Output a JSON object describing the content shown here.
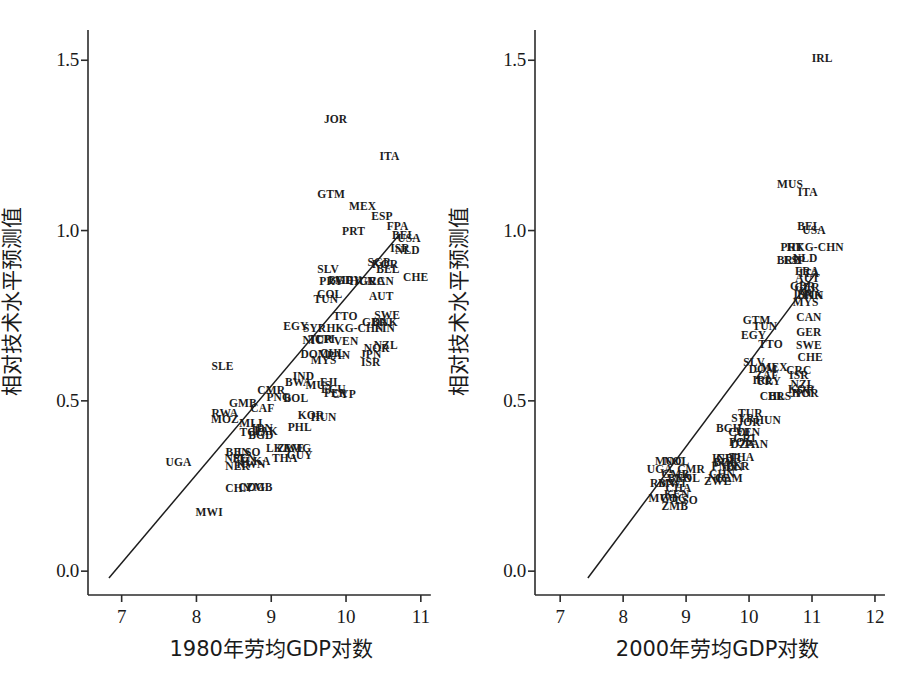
{
  "figure": {
    "width": 901,
    "height": 677,
    "background": "#ffffff",
    "ink_color": "#1d1d1d"
  },
  "chart_data": [
    {
      "type": "scatter",
      "panel": "left",
      "title": "",
      "xlabel": "1980年劳均GDP对数",
      "ylabel": "相对技术水平预测值",
      "xlim": [
        6.55,
        11.35
      ],
      "ylim": [
        -0.07,
        1.58
      ],
      "xticks": [
        7,
        8,
        9,
        10,
        11
      ],
      "xtick_labels": [
        "7",
        "8",
        "9",
        "10",
        "11"
      ],
      "yticks": [
        0.0,
        0.5,
        1.0,
        1.5
      ],
      "ytick_labels": [
        "0.0",
        "0.5",
        "1.0",
        "1.5"
      ],
      "grid": false,
      "legend": "none",
      "fit_line": {
        "x0": 6.83,
        "y0": -0.02,
        "x1": 10.72,
        "y1": 0.99
      },
      "point_label_field": "iso3",
      "points": [
        {
          "iso3": "JOR",
          "x": 9.86,
          "y": 1.325
        },
        {
          "iso3": "ITA",
          "x": 10.58,
          "y": 1.215
        },
        {
          "iso3": "GTM",
          "x": 9.8,
          "y": 1.105
        },
        {
          "iso3": "MEX",
          "x": 10.22,
          "y": 1.07
        },
        {
          "iso3": "ESP",
          "x": 10.48,
          "y": 1.04
        },
        {
          "iso3": "FPA",
          "x": 10.69,
          "y": 1.01
        },
        {
          "iso3": "PRT",
          "x": 10.1,
          "y": 0.995
        },
        {
          "iso3": "BEL",
          "x": 10.77,
          "y": 0.985
        },
        {
          "iso3": "USA",
          "x": 10.84,
          "y": 0.975
        },
        {
          "iso3": "ISR",
          "x": 10.72,
          "y": 0.945
        },
        {
          "iso3": "NLD",
          "x": 10.82,
          "y": 0.94
        },
        {
          "iso3": "SGP",
          "x": 10.44,
          "y": 0.905
        },
        {
          "iso3": "KOR",
          "x": 10.52,
          "y": 0.898
        },
        {
          "iso3": "SLV",
          "x": 9.76,
          "y": 0.885
        },
        {
          "iso3": "BEL2",
          "x": 10.56,
          "y": 0.885
        },
        {
          "iso3": "CHE",
          "x": 10.93,
          "y": 0.862
        },
        {
          "iso3": "PRY",
          "x": 9.8,
          "y": 0.85
        },
        {
          "iso3": "BGD2",
          "x": 9.93,
          "y": 0.852
        },
        {
          "iso3": "MFY",
          "x": 10.03,
          "y": 0.852
        },
        {
          "iso3": "HUN2",
          "x": 10.22,
          "y": 0.848
        },
        {
          "iso3": "GRC",
          "x": 10.35,
          "y": 0.848
        },
        {
          "iso3": "CAN",
          "x": 10.47,
          "y": 0.848
        },
        {
          "iso3": "COL",
          "x": 9.78,
          "y": 0.81
        },
        {
          "iso3": "AUT",
          "x": 10.47,
          "y": 0.805
        },
        {
          "iso3": "TUN",
          "x": 9.73,
          "y": 0.795
        },
        {
          "iso3": "TTO",
          "x": 9.99,
          "y": 0.745
        },
        {
          "iso3": "SWE",
          "x": 10.55,
          "y": 0.748
        },
        {
          "iso3": "GBR",
          "x": 10.38,
          "y": 0.73
        },
        {
          "iso3": "DNK",
          "x": 10.52,
          "y": 0.728
        },
        {
          "iso3": "EGY",
          "x": 9.33,
          "y": 0.718
        },
        {
          "iso3": "SYR",
          "x": 9.58,
          "y": 0.71
        },
        {
          "iso3": "HKG-CHN",
          "x": 10.12,
          "y": 0.712
        },
        {
          "iso3": "FIN",
          "x": 10.52,
          "y": 0.71
        },
        {
          "iso3": "NIC",
          "x": 9.56,
          "y": 0.675
        },
        {
          "iso3": "TUR",
          "x": 9.66,
          "y": 0.678
        },
        {
          "iso3": "CPI",
          "x": 9.72,
          "y": 0.678
        },
        {
          "iso3": "VEN",
          "x": 10.0,
          "y": 0.672
        },
        {
          "iso3": "NOR",
          "x": 10.41,
          "y": 0.652
        },
        {
          "iso3": "NZL",
          "x": 10.53,
          "y": 0.66
        },
        {
          "iso3": "DOM",
          "x": 9.58,
          "y": 0.635
        },
        {
          "iso3": "CHL",
          "x": 9.82,
          "y": 0.638
        },
        {
          "iso3": "PAN",
          "x": 9.9,
          "y": 0.632
        },
        {
          "iso3": "JPN",
          "x": 10.33,
          "y": 0.635
        },
        {
          "iso3": "MYS",
          "x": 9.7,
          "y": 0.618
        },
        {
          "iso3": "ISR2",
          "x": 10.33,
          "y": 0.612
        },
        {
          "iso3": "SLE",
          "x": 8.35,
          "y": 0.6
        },
        {
          "iso3": "IND",
          "x": 9.43,
          "y": 0.57
        },
        {
          "iso3": "BWA",
          "x": 9.36,
          "y": 0.553
        },
        {
          "iso3": "MUS",
          "x": 9.63,
          "y": 0.545
        },
        {
          "iso3": "FJI",
          "x": 9.77,
          "y": 0.552
        },
        {
          "iso3": "ECU",
          "x": 9.83,
          "y": 0.533
        },
        {
          "iso3": "PER",
          "x": 9.86,
          "y": 0.52
        },
        {
          "iso3": "CYP",
          "x": 9.97,
          "y": 0.517
        },
        {
          "iso3": "CMR",
          "x": 9.0,
          "y": 0.528
        },
        {
          "iso3": "PNG",
          "x": 9.1,
          "y": 0.508
        },
        {
          "iso3": "BOL",
          "x": 9.33,
          "y": 0.505
        },
        {
          "iso3": "GMB",
          "x": 8.62,
          "y": 0.49
        },
        {
          "iso3": "CAF",
          "x": 8.88,
          "y": 0.477
        },
        {
          "iso3": "RWA",
          "x": 8.38,
          "y": 0.462
        },
        {
          "iso3": "KOR2",
          "x": 9.53,
          "y": 0.455
        },
        {
          "iso3": "HUN",
          "x": 9.7,
          "y": 0.45
        },
        {
          "iso3": "MOZ",
          "x": 8.38,
          "y": 0.443
        },
        {
          "iso3": "MLI",
          "x": 8.73,
          "y": 0.433
        },
        {
          "iso3": "IDN",
          "x": 8.88,
          "y": 0.418
        },
        {
          "iso3": "PAK",
          "x": 8.93,
          "y": 0.41
        },
        {
          "iso3": "TGO",
          "x": 8.75,
          "y": 0.405
        },
        {
          "iso3": "BGD",
          "x": 8.86,
          "y": 0.398
        },
        {
          "iso3": "PHL",
          "x": 9.38,
          "y": 0.42
        },
        {
          "iso3": "LKA",
          "x": 9.1,
          "y": 0.36
        },
        {
          "iso3": "ZWE",
          "x": 9.26,
          "y": 0.36
        },
        {
          "iso3": "EMG",
          "x": 9.35,
          "y": 0.358
        },
        {
          "iso3": "GUY",
          "x": 9.38,
          "y": 0.338
        },
        {
          "iso3": "BEN",
          "x": 8.55,
          "y": 0.348
        },
        {
          "iso3": "LSO",
          "x": 8.7,
          "y": 0.348
        },
        {
          "iso3": "NPL",
          "x": 8.53,
          "y": 0.33
        },
        {
          "iso3": "SEN",
          "x": 8.64,
          "y": 0.33
        },
        {
          "iso3": "THA",
          "x": 9.18,
          "y": 0.33
        },
        {
          "iso3": "ILKA",
          "x": 8.79,
          "y": 0.322
        },
        {
          "iso3": "KWN",
          "x": 8.73,
          "y": 0.312
        },
        {
          "iso3": "NER",
          "x": 8.55,
          "y": 0.305
        },
        {
          "iso3": "UGA",
          "x": 7.76,
          "y": 0.318
        },
        {
          "iso3": "CHN",
          "x": 8.56,
          "y": 0.24
        },
        {
          "iso3": "COG",
          "x": 8.74,
          "y": 0.245
        },
        {
          "iso3": "ZMB",
          "x": 8.84,
          "y": 0.243
        },
        {
          "iso3": "MWI",
          "x": 8.17,
          "y": 0.17
        }
      ]
    },
    {
      "type": "scatter",
      "panel": "right",
      "title": "",
      "xlabel": "2000年劳均GDP对数",
      "ylabel": "相对技术水平预测值",
      "xlim": [
        6.6,
        12.35
      ],
      "ylim": [
        -0.07,
        1.58
      ],
      "xticks": [
        7,
        8,
        9,
        10,
        11,
        12
      ],
      "xtick_labels": [
        "7",
        "8",
        "9",
        "10",
        "11",
        "12"
      ],
      "yticks": [
        0.0,
        0.5,
        1.0,
        1.5
      ],
      "ytick_labels": [
        "0.0",
        "0.5",
        "1.0",
        "1.5"
      ],
      "grid": false,
      "legend": "none",
      "fit_line": {
        "x0": 7.44,
        "y0": -0.02,
        "x1": 11.07,
        "y1": 0.878
      },
      "point_label_field": "iso3",
      "points": [
        {
          "iso3": "IRL",
          "x": 11.16,
          "y": 1.505
        },
        {
          "iso3": "MUS",
          "x": 10.65,
          "y": 1.135
        },
        {
          "iso3": "ITA",
          "x": 10.93,
          "y": 1.11
        },
        {
          "iso3": "BEL",
          "x": 10.95,
          "y": 1.01
        },
        {
          "iso3": "USA",
          "x": 11.03,
          "y": 0.998
        },
        {
          "iso3": "PRT",
          "x": 10.68,
          "y": 0.95
        },
        {
          "iso3": "HKG-CHN",
          "x": 11.05,
          "y": 0.948
        },
        {
          "iso3": "BRB",
          "x": 10.63,
          "y": 0.912
        },
        {
          "iso3": "ESP",
          "x": 10.72,
          "y": 0.912
        },
        {
          "iso3": "NLD",
          "x": 10.89,
          "y": 0.918
        },
        {
          "iso3": "FRA",
          "x": 10.92,
          "y": 0.878
        },
        {
          "iso3": "ITA2",
          "x": 10.95,
          "y": 0.872
        },
        {
          "iso3": "AUT",
          "x": 10.93,
          "y": 0.858
        },
        {
          "iso3": "GBR",
          "x": 10.85,
          "y": 0.835
        },
        {
          "iso3": "GER2",
          "x": 10.92,
          "y": 0.832
        },
        {
          "iso3": "ISR",
          "x": 10.86,
          "y": 0.812
        },
        {
          "iso3": "DNK",
          "x": 10.97,
          "y": 0.808
        },
        {
          "iso3": "FIN",
          "x": 11.02,
          "y": 0.808
        },
        {
          "iso3": "MYS",
          "x": 10.9,
          "y": 0.788
        },
        {
          "iso3": "CAN",
          "x": 10.95,
          "y": 0.742
        },
        {
          "iso3": "GER",
          "x": 10.95,
          "y": 0.7
        },
        {
          "iso3": "SWE",
          "x": 10.95,
          "y": 0.662
        },
        {
          "iso3": "CHE",
          "x": 10.97,
          "y": 0.625
        },
        {
          "iso3": "GTM",
          "x": 10.12,
          "y": 0.735
        },
        {
          "iso3": "TUN",
          "x": 10.25,
          "y": 0.718
        },
        {
          "iso3": "EGY",
          "x": 10.07,
          "y": 0.69
        },
        {
          "iso3": "TTO",
          "x": 10.34,
          "y": 0.665
        },
        {
          "iso3": "CRC",
          "x": 10.79,
          "y": 0.588
        },
        {
          "iso3": "ISR2",
          "x": 10.79,
          "y": 0.572
        },
        {
          "iso3": "SLV",
          "x": 10.08,
          "y": 0.612
        },
        {
          "iso3": "DOM",
          "x": 10.22,
          "y": 0.592
        },
        {
          "iso3": "MEX",
          "x": 10.4,
          "y": 0.597
        },
        {
          "iso3": "ZAF",
          "x": 10.28,
          "y": 0.573
        },
        {
          "iso3": "IRL2",
          "x": 10.22,
          "y": 0.557
        },
        {
          "iso3": "URY",
          "x": 10.31,
          "y": 0.555
        },
        {
          "iso3": "NZL",
          "x": 10.85,
          "y": 0.548
        },
        {
          "iso3": "KOR",
          "x": 10.83,
          "y": 0.533
        },
        {
          "iso3": "JPN",
          "x": 10.82,
          "y": 0.52
        },
        {
          "iso3": "NOR",
          "x": 10.9,
          "y": 0.52
        },
        {
          "iso3": "CHL",
          "x": 10.37,
          "y": 0.51
        },
        {
          "iso3": "BRS",
          "x": 10.49,
          "y": 0.512
        },
        {
          "iso3": "TUR",
          "x": 10.02,
          "y": 0.462
        },
        {
          "iso3": "SYR",
          "x": 9.9,
          "y": 0.448
        },
        {
          "iso3": "JOR",
          "x": 10.0,
          "y": 0.435
        },
        {
          "iso3": "HUN",
          "x": 10.3,
          "y": 0.442
        },
        {
          "iso3": "BGH",
          "x": 9.68,
          "y": 0.418
        },
        {
          "iso3": "COL",
          "x": 9.87,
          "y": 0.405
        },
        {
          "iso3": "VEN",
          "x": 9.98,
          "y": 0.405
        },
        {
          "iso3": "GRI",
          "x": 9.93,
          "y": 0.388
        },
        {
          "iso3": "POL",
          "x": 9.87,
          "y": 0.375
        },
        {
          "iso3": "DZA",
          "x": 9.9,
          "y": 0.37
        },
        {
          "iso3": "PAN",
          "x": 10.12,
          "y": 0.37
        },
        {
          "iso3": "IND",
          "x": 9.58,
          "y": 0.33
        },
        {
          "iso3": "GBR2",
          "x": 9.68,
          "y": 0.33
        },
        {
          "iso3": "THA",
          "x": 9.88,
          "y": 0.332
        },
        {
          "iso3": "BOL",
          "x": 9.63,
          "y": 0.318
        },
        {
          "iso3": "PNG",
          "x": 9.6,
          "y": 0.305
        },
        {
          "iso3": "IDN",
          "x": 9.73,
          "y": 0.302
        },
        {
          "iso3": "PER",
          "x": 9.82,
          "y": 0.305
        },
        {
          "iso3": "CHN",
          "x": 9.57,
          "y": 0.282
        },
        {
          "iso3": "NIC",
          "x": 9.52,
          "y": 0.27
        },
        {
          "iso3": "CAM",
          "x": 9.68,
          "y": 0.27
        },
        {
          "iso3": "ZWE",
          "x": 9.5,
          "y": 0.262
        },
        {
          "iso3": "MOC",
          "x": 8.73,
          "y": 0.32
        },
        {
          "iso3": "NOL",
          "x": 8.85,
          "y": 0.32
        },
        {
          "iso3": "UGA",
          "x": 8.58,
          "y": 0.298
        },
        {
          "iso3": "CMR",
          "x": 9.08,
          "y": 0.298
        },
        {
          "iso3": "GMB",
          "x": 8.83,
          "y": 0.282
        },
        {
          "iso3": "BEN",
          "x": 8.9,
          "y": 0.27
        },
        {
          "iso3": "NOL2",
          "x": 9.02,
          "y": 0.27
        },
        {
          "iso3": "RBN",
          "x": 8.62,
          "y": 0.255
        },
        {
          "iso3": "MWI2",
          "x": 8.78,
          "y": 0.255
        },
        {
          "iso3": "CHA",
          "x": 8.88,
          "y": 0.24
        },
        {
          "iso3": "KEN",
          "x": 8.85,
          "y": 0.225
        },
        {
          "iso3": "MWI",
          "x": 8.62,
          "y": 0.212
        },
        {
          "iso3": "COG",
          "x": 8.8,
          "y": 0.212
        },
        {
          "iso3": "LSO",
          "x": 9.0,
          "y": 0.205
        },
        {
          "iso3": "ZMB",
          "x": 8.82,
          "y": 0.188
        }
      ]
    }
  ],
  "labels": {
    "left": {
      "y_axis_title": "相对技术水平预测值",
      "x_axis_title": "1980年劳均GDP对数",
      "ytick_labels": [
        "1.5",
        "1.0",
        "0.5",
        "0.0"
      ],
      "xtick_labels": [
        "7",
        "8",
        "9",
        "10",
        "11"
      ]
    },
    "right": {
      "y_axis_title": "相对技术水平预测值",
      "x_axis_title": "2000年劳均GDP对数",
      "ytick_labels": [
        "1.5",
        "1.0",
        "0.5",
        "0.0"
      ],
      "xtick_labels": [
        "7",
        "8",
        "9",
        "10",
        "11",
        "12"
      ]
    }
  }
}
